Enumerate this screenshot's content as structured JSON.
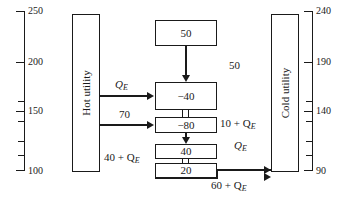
{
  "figure": {
    "type": "heat-cascade-diagram",
    "caption": ""
  },
  "left_axis": {
    "name": "left-temperature-axis",
    "labels": [
      "250",
      "200",
      "150",
      "100"
    ],
    "label_positions_px": [
      11,
      62,
      111,
      170
    ],
    "major_ticks_px": [
      11,
      62,
      111,
      170
    ],
    "minor_ticks_px": [
      101,
      121,
      141,
      155
    ]
  },
  "right_axis": {
    "name": "right-temperature-axis",
    "labels": [
      "240",
      "190",
      "140",
      "90"
    ],
    "label_positions_px": [
      11,
      62,
      111,
      170
    ],
    "major_ticks_px": [
      11,
      62,
      111,
      170
    ],
    "minor_ticks_px": [
      101,
      121,
      141,
      155
    ]
  },
  "utilities": {
    "hot": {
      "label": "Hot utility"
    },
    "cold": {
      "label": "Cold utility"
    }
  },
  "intervals": [
    {
      "id": "interval-1",
      "value": "50"
    },
    {
      "id": "interval-2",
      "value": "−40"
    },
    {
      "id": "interval-3",
      "value": "−80"
    },
    {
      "id": "interval-4",
      "value": "40"
    },
    {
      "id": "interval-5",
      "value": "20"
    }
  ],
  "flows": {
    "hot_to_interval2": "Q",
    "hot_to_interval2_sub": "E",
    "hot_to_interval3": "70",
    "cascade_top": "50",
    "cascade_mid": "10 + Q",
    "cascade_mid_sub": "E",
    "cascade_lower": "Q",
    "cascade_lower_sub": "E",
    "left_bottom": "40 + Q",
    "left_bottom_sub": "E",
    "to_cold": "60 + Q",
    "to_cold_sub": "E"
  },
  "colors": {
    "ink": "#1a1a1a",
    "paper": "#ffffff"
  }
}
